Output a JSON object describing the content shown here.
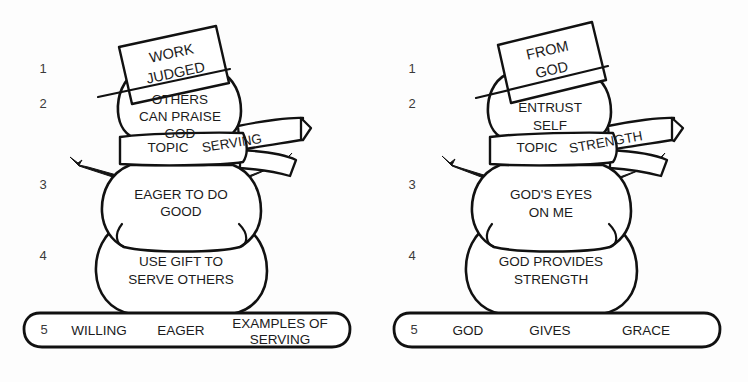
{
  "page": {
    "background_color": "#fdfdfd",
    "ink_color": "#111111",
    "fill_color": "#ffffff"
  },
  "figures": [
    {
      "id": "serving",
      "side": "left",
      "hat": {
        "line1": "WORK",
        "line2": "JUDGED"
      },
      "head": {
        "line1": "OTHERS",
        "line2": "CAN PRAISE",
        "line3": "GOD"
      },
      "scarf": {
        "label": "TOPIC",
        "topic": "SERVING"
      },
      "upper_body": {
        "line1": "EAGER TO DO",
        "line2": "GOOD"
      },
      "lower_body": {
        "line1": "USE GIFT TO",
        "line2": "SERVE OTHERS"
      },
      "base": {
        "number": "5",
        "item1": "WILLING",
        "item2": "EAGER",
        "item3_line1": "EXAMPLES OF",
        "item3_line2": "SERVING"
      },
      "margin_numbers": [
        "1",
        "2",
        "3",
        "4"
      ]
    },
    {
      "id": "strength",
      "side": "right",
      "hat": {
        "line1": "FROM",
        "line2": "GOD"
      },
      "head": {
        "line1": "ENTRUST",
        "line2": "SELF",
        "line3": ""
      },
      "scarf": {
        "label": "TOPIC",
        "topic": "STRENGTH"
      },
      "upper_body": {
        "line1": "GOD'S EYES",
        "line2": "ON  ME"
      },
      "lower_body": {
        "line1": "GOD  PROVIDES",
        "line2": "STRENGTH"
      },
      "base": {
        "number": "5",
        "item1": "GOD",
        "item2": "GIVES",
        "item3_line1": "GRACE",
        "item3_line2": ""
      },
      "margin_numbers": [
        "1",
        "2",
        "3",
        "4"
      ]
    }
  ]
}
